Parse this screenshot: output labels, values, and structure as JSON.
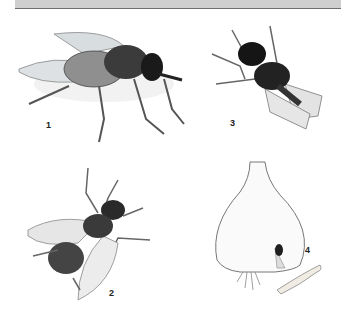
{
  "header_bar": {
    "color": "#cfcfcf",
    "rule_color": "#6f6f6f"
  },
  "figures": [
    {
      "id": 1,
      "label": "1",
      "subject": "housefly side view",
      "icon": "fly-side-icon"
    },
    {
      "id": 2,
      "label": "2",
      "subject": "fly dorsal view, wings spread",
      "icon": "fly-top-icon"
    },
    {
      "id": 3,
      "label": "3",
      "subject": "dark fly, top view",
      "icon": "fly-dark-icon"
    },
    {
      "id": 4,
      "label": "4",
      "subject": "onion bulb with maggot and larva",
      "icon": "onion-bulb-icon"
    }
  ]
}
